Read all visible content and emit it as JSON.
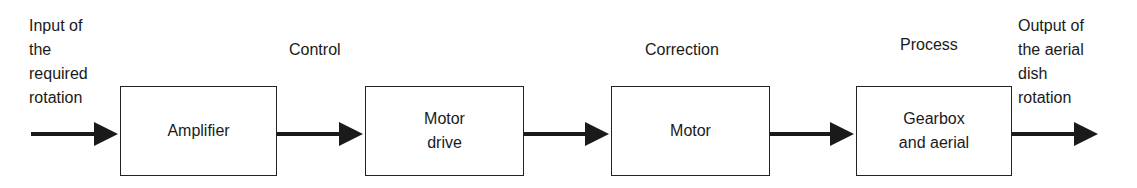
{
  "diagram": {
    "input_label": "Input of\nthe\nrequired\nrotation",
    "output_label": "Output of\nthe  aerial\ndish\nrotation",
    "signal_labels": [
      "Control",
      "Correction",
      "Process"
    ],
    "blocks": [
      {
        "label": "Amplifier"
      },
      {
        "label": "Motor\ndrive"
      },
      {
        "label": "Motor"
      },
      {
        "label": "Gearbox\nand aerial"
      }
    ],
    "colors": {
      "line": "#1a1a1a",
      "box_border": "#222222",
      "background": "#ffffff"
    }
  }
}
